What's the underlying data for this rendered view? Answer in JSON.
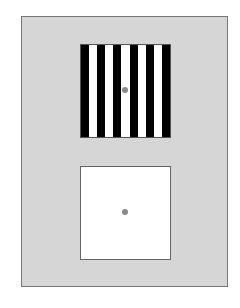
{
  "figure": {
    "background_color": "#d6d6d6",
    "top_square": {
      "type": "vertical-grating",
      "stripe_count": 11,
      "stripes": [
        "#000000",
        "#ffffff",
        "#000000",
        "#ffffff",
        "#000000",
        "#ffffff",
        "#000000",
        "#ffffff",
        "#000000",
        "#ffffff",
        "#000000"
      ],
      "fixation_dot_color": "#8a8a8a"
    },
    "bottom_square": {
      "type": "uniform-field",
      "fill_color": "#ffffff",
      "fixation_dot_color": "#8a8a8a"
    }
  }
}
